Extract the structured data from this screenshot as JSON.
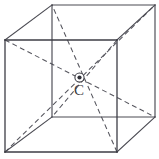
{
  "figure": {
    "type": "geometry-diagram",
    "canvas": {
      "width": 159,
      "height": 159,
      "background": "#ffffff"
    },
    "colors": {
      "edge_solid": "#4a4a52",
      "edge_front": "#3d3d45",
      "diagonal_dashed": "#55555d",
      "center_marker": "#2e2e36",
      "label": "#3a3a42"
    },
    "labels": [
      {
        "id": "center-label",
        "text": "C",
        "x": 74,
        "y": 95,
        "meaning": "centre of the cube"
      }
    ],
    "center_point": {
      "name": "C",
      "x": 79.5,
      "y": 77.5,
      "marker": "circled-dot"
    },
    "vertices": {
      "front_top_left": {
        "x": 5,
        "y": 40
      },
      "front_top_right": {
        "x": 117,
        "y": 40
      },
      "front_bottom_right": {
        "x": 117,
        "y": 152
      },
      "front_bottom_left": {
        "x": 5,
        "y": 152
      },
      "back_top_left": {
        "x": 52,
        "y": 5
      },
      "back_top_right": {
        "x": 155,
        "y": 5
      },
      "back_bottom_right": {
        "x": 155,
        "y": 117
      },
      "back_bottom_left": {
        "x": 52,
        "y": 117
      }
    },
    "edges": [
      {
        "name": "front-top",
        "style": "solid",
        "from": "front_top_left",
        "to": "front_top_right"
      },
      {
        "name": "front-right",
        "style": "solid",
        "from": "front_top_right",
        "to": "front_bottom_right"
      },
      {
        "name": "front-bottom",
        "style": "solid",
        "from": "front_bottom_right",
        "to": "front_bottom_left"
      },
      {
        "name": "front-left",
        "style": "solid",
        "from": "front_bottom_left",
        "to": "front_top_left"
      },
      {
        "name": "back-top",
        "style": "solid",
        "from": "back_top_left",
        "to": "back_top_right"
      },
      {
        "name": "back-right",
        "style": "solid",
        "from": "back_top_right",
        "to": "back_bottom_right"
      },
      {
        "name": "back-bottom",
        "style": "solid",
        "from": "back_bottom_right",
        "to": "back_bottom_left"
      },
      {
        "name": "back-left",
        "style": "solid",
        "from": "back_bottom_left",
        "to": "back_top_left"
      },
      {
        "name": "connector-top-left",
        "style": "solid",
        "from": "front_top_left",
        "to": "back_top_left"
      },
      {
        "name": "connector-top-right",
        "style": "solid",
        "from": "front_top_right",
        "to": "back_top_right"
      },
      {
        "name": "connector-bottom-right",
        "style": "solid",
        "from": "front_bottom_right",
        "to": "back_bottom_right"
      },
      {
        "name": "connector-bottom-left",
        "style": "solid",
        "from": "front_bottom_left",
        "to": "back_bottom_left"
      }
    ],
    "diagonals": [
      {
        "name": "diagonal-1",
        "style": "dashed",
        "from": "front_top_left",
        "to": "back_bottom_right"
      },
      {
        "name": "diagonal-2",
        "style": "dashed",
        "from": "front_top_right",
        "to": "back_bottom_left"
      },
      {
        "name": "diagonal-3",
        "style": "dashed",
        "from": "front_bottom_left",
        "to": "back_top_right"
      },
      {
        "name": "diagonal-4",
        "style": "dashed",
        "from": "front_bottom_right",
        "to": "back_top_left"
      }
    ]
  }
}
